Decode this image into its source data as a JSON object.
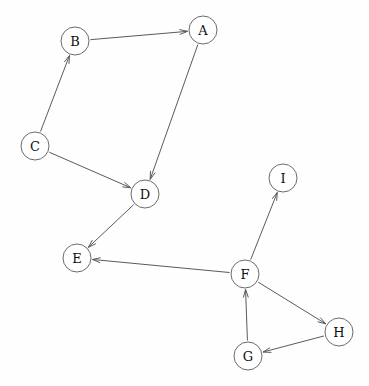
{
  "diagram": {
    "type": "directed-graph",
    "title": "",
    "background_color": "#fefefe",
    "node_radius": 14,
    "node_fill": "#ffffff",
    "node_stroke": "#6b6b6b",
    "edge_stroke": "#5a5a5a",
    "label_color": "#101010",
    "nodes": [
      {
        "id": "A",
        "label": "A",
        "x": 203,
        "y": 30
      },
      {
        "id": "B",
        "label": "B",
        "x": 75,
        "y": 41
      },
      {
        "id": "C",
        "label": "C",
        "x": 35,
        "y": 146
      },
      {
        "id": "D",
        "label": "D",
        "x": 145,
        "y": 194
      },
      {
        "id": "E",
        "label": "E",
        "x": 77,
        "y": 258
      },
      {
        "id": "F",
        "label": "F",
        "x": 245,
        "y": 274
      },
      {
        "id": "G",
        "label": "G",
        "x": 248,
        "y": 356
      },
      {
        "id": "H",
        "label": "H",
        "x": 339,
        "y": 332
      },
      {
        "id": "I",
        "label": "I",
        "x": 283,
        "y": 178
      }
    ],
    "edges": [
      {
        "from": "B",
        "to": "A",
        "directed": true
      },
      {
        "from": "C",
        "to": "B",
        "directed": true
      },
      {
        "from": "C",
        "to": "D",
        "directed": true
      },
      {
        "from": "A",
        "to": "D",
        "directed": true
      },
      {
        "from": "D",
        "to": "E",
        "directed": true
      },
      {
        "from": "F",
        "to": "E",
        "directed": true
      },
      {
        "from": "F",
        "to": "I",
        "directed": true
      },
      {
        "from": "F",
        "to": "H",
        "directed": true
      },
      {
        "from": "H",
        "to": "G",
        "directed": true
      },
      {
        "from": "G",
        "to": "F",
        "directed": true
      }
    ]
  }
}
